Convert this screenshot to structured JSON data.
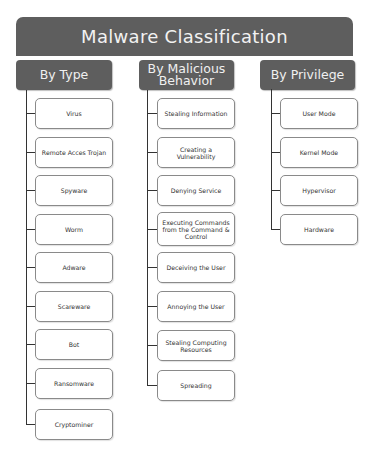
{
  "title": "Malware Classification",
  "colors": {
    "header_bg": "#5e5e5e",
    "header_text": "#f2f2f2",
    "leaf_border": "#8a8a8a"
  },
  "columns": [
    {
      "header": "By Type",
      "items": [
        "Virus",
        "Remote Acces Trojan",
        "Spyware",
        "Worm",
        "Adware",
        "Scareware",
        "Bot",
        "Ransomware",
        "Cryptominer"
      ]
    },
    {
      "header": "By Malicious Behavior",
      "items": [
        "Stealing Information",
        "Creating a Vulnerability",
        "Denying Service",
        "Executing Commands from the Command & Control",
        "Deceiving the User",
        "Annoying the User",
        "Stealing Computing Resources",
        "Spreading"
      ]
    },
    {
      "header": "By Privilege",
      "items": [
        "User Mode",
        "Kernel Mode",
        "Hypervisor",
        "Hardware"
      ]
    }
  ]
}
